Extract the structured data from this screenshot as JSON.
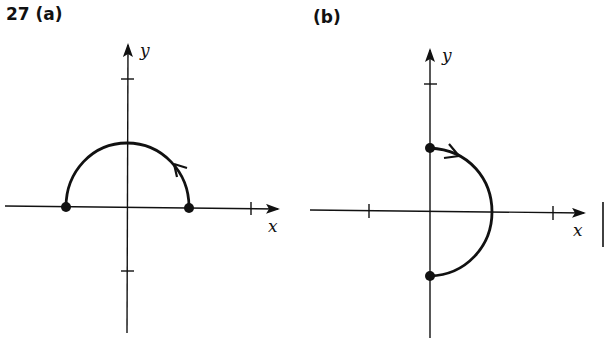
{
  "problem_number": "27",
  "panels": [
    {
      "id": "a",
      "label": "(a)",
      "x_axis_label": "x",
      "y_axis_label": "y",
      "curve": "upper semicircle from (1,0) counterclockwise to (-1,0)",
      "endpoints": [
        [
          1,
          0
        ],
        [
          -1,
          0
        ]
      ],
      "direction_arrow_near": "right side, heading up-left"
    },
    {
      "id": "b",
      "label": "(b)",
      "x_axis_label": "x",
      "y_axis_label": "y",
      "curve": "right semicircle from (0,1) clockwise to (0,-1)",
      "endpoints": [
        [
          0,
          1
        ],
        [
          0,
          -1
        ]
      ],
      "direction_arrow_near": "top, heading right"
    }
  ],
  "colors": {
    "ink": "#111111",
    "background": "#ffffff"
  }
}
